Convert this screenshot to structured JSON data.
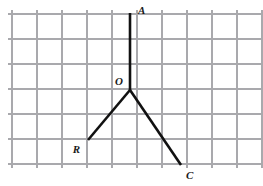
{
  "figure": {
    "type": "geometry-diagram",
    "width": 263,
    "height": 186,
    "background_color": "#ffffff",
    "grid": {
      "visible": true,
      "line_color": "#a9a9ad",
      "spacing": 25,
      "x_start": 12,
      "y_start": 14,
      "vertical_line_x": [
        12,
        37,
        62,
        87,
        112,
        137,
        162,
        187,
        212,
        237,
        262
      ],
      "horizontal_line_y": [
        14,
        39,
        64,
        89,
        114,
        139,
        164
      ],
      "overhang": 4
    },
    "rays": {
      "color": "#111111",
      "stroke_width": 2.6,
      "items": [
        {
          "name": "ray-OA",
          "from": [
            130,
            90
          ],
          "to": [
            130,
            13
          ],
          "endpoint_label": "A"
        },
        {
          "name": "ray-OR",
          "from": [
            130,
            90
          ],
          "to": [
            88,
            140
          ],
          "endpoint_label": "R"
        },
        {
          "name": "ray-OC",
          "from": [
            130,
            90
          ],
          "to": [
            181,
            165
          ],
          "endpoint_label": "C"
        }
      ]
    },
    "labels": [
      {
        "name": "label-A",
        "text": "A",
        "x": 138,
        "y": 14,
        "anchor": "start"
      },
      {
        "name": "label-O",
        "text": "O",
        "x": 123,
        "y": 85,
        "anchor": "end"
      },
      {
        "name": "label-R",
        "text": "R",
        "x": 80,
        "y": 153,
        "anchor": "end"
      },
      {
        "name": "label-C",
        "text": "C",
        "x": 186,
        "y": 179,
        "anchor": "start"
      }
    ],
    "vertex": {
      "name": "O",
      "x": 130,
      "y": 90
    }
  }
}
